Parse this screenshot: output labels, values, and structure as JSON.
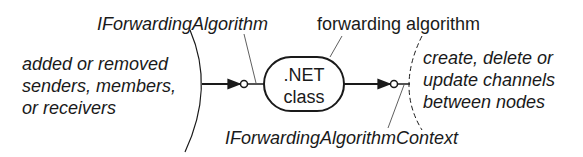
{
  "diagram": {
    "input_label": [
      "added or removed",
      "senders, members,",
      "or receivers"
    ],
    "output_label": [
      "create, delete or",
      "update channels",
      "between nodes"
    ],
    "component_label": [
      ".NET",
      "class"
    ],
    "component_annotation": "forwarding algorithm",
    "input_interface": "IForwardingAlgorithm",
    "output_interface": "IForwardingAlgorithmContext",
    "colors": {
      "stroke": "#1a1a1a",
      "text": "#1a1a1a",
      "background": "#ffffff"
    }
  }
}
